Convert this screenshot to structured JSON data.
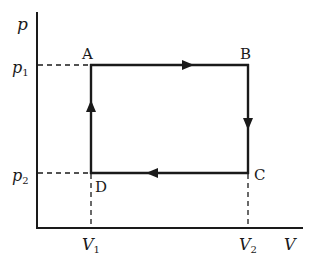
{
  "diagram": {
    "type": "p-V cycle",
    "axes": {
      "y_label": "p",
      "x_label": "V",
      "p_ticks": [
        {
          "main": "p",
          "sub": "1"
        },
        {
          "main": "p",
          "sub": "2"
        }
      ],
      "v_ticks": [
        {
          "main": "V",
          "sub": "1"
        },
        {
          "main": "V",
          "sub": "2"
        }
      ]
    },
    "points": {
      "A": {
        "label": "A",
        "state": "(V1, p1)"
      },
      "B": {
        "label": "B",
        "state": "(V2, p1)"
      },
      "C": {
        "label": "C",
        "state": "(V2, p2)"
      },
      "D": {
        "label": "D",
        "state": "(V1, p2)"
      }
    },
    "process_order": [
      "A",
      "B",
      "C",
      "D",
      "A"
    ],
    "colors": {
      "line": "#1a1a1a",
      "background": "#ffffff"
    }
  }
}
